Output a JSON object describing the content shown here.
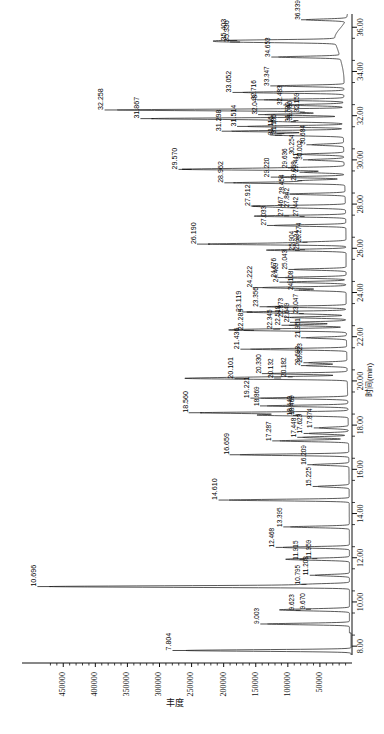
{
  "figure": {
    "name": "gc-ms-total-ion-chromatogram",
    "orientation": "rotated-90-ccw",
    "abundance_axis_title": "丰度",
    "time_axis_title": "时间(min)"
  },
  "chart_data": {
    "type": "line",
    "title": "",
    "subtitle": "",
    "xlabel": "时间(min)",
    "ylabel": "丰度",
    "xlim": [
      7.6,
      36.6
    ],
    "ylim": [
      0,
      480000
    ],
    "grid": false,
    "legend": "none",
    "x_tick_labels": [
      "8.00",
      "10.00",
      "12.00",
      "14.00",
      "16.00",
      "18.00",
      "20.00",
      "22.00",
      "24.00",
      "26.00",
      "28.00",
      "30.00",
      "32.00",
      "34.00",
      "36.00"
    ],
    "x_tick_values": [
      8,
      10,
      12,
      14,
      16,
      18,
      20,
      22,
      24,
      26,
      28,
      30,
      32,
      34,
      36
    ],
    "x_minor_tick_step": 0.5,
    "y_tick_labels": [
      "50000",
      "100000",
      "150000",
      "200000",
      "250000",
      "300000",
      "350000",
      "400000",
      "450000"
    ],
    "y_tick_values": [
      50000,
      100000,
      150000,
      200000,
      250000,
      300000,
      350000,
      400000,
      450000
    ],
    "y_minor_tick_step": 10000,
    "peaks": [
      {
        "rt": "7.804",
        "x": 7.804,
        "y": 258000
      },
      {
        "rt": "9.003",
        "x": 9.003,
        "y": 128000
      },
      {
        "rt": "9.623",
        "x": 9.623,
        "y": 76000
      },
      {
        "rt": "9.670",
        "x": 9.67,
        "y": 60000
      },
      {
        "rt": "10.696",
        "x": 10.696,
        "y": 466000
      },
      {
        "rt": "10.795",
        "x": 10.795,
        "y": 67000
      },
      {
        "rt": "11.208",
        "x": 11.208,
        "y": 54000
      },
      {
        "rt": "11.915",
        "x": 11.915,
        "y": 70000
      },
      {
        "rt": "11.959",
        "x": 11.959,
        "y": 50000
      },
      {
        "rt": "12.468",
        "x": 12.468,
        "y": 104000
      },
      {
        "rt": "13.395",
        "x": 13.395,
        "y": 92000
      },
      {
        "rt": "14.610",
        "x": 14.61,
        "y": 188000
      },
      {
        "rt": "15.225",
        "x": 15.225,
        "y": 49000
      },
      {
        "rt": "16.209",
        "x": 16.209,
        "y": 57000
      },
      {
        "rt": "16.659",
        "x": 16.659,
        "y": 170000
      },
      {
        "rt": "17.287",
        "x": 17.287,
        "y": 108000
      },
      {
        "rt": "17.448",
        "x": 17.448,
        "y": 72000
      },
      {
        "rt": "17.623",
        "x": 17.623,
        "y": 62000
      },
      {
        "rt": "17.874",
        "x": 17.874,
        "y": 46000
      },
      {
        "rt": "18.440",
        "x": 18.44,
        "y": 78000
      },
      {
        "rt": "18.469",
        "x": 18.469,
        "y": 74000
      },
      {
        "rt": "18.560",
        "x": 18.56,
        "y": 228000
      },
      {
        "rt": "18.869",
        "x": 18.869,
        "y": 126000
      },
      {
        "rt": "19.221",
        "x": 19.221,
        "y": 136000
      },
      {
        "rt": "20.101",
        "x": 20.101,
        "y": 160000
      },
      {
        "rt": "20.132",
        "x": 20.132,
        "y": 103000
      },
      {
        "rt": "20.182",
        "x": 20.182,
        "y": 85000
      },
      {
        "rt": "20.330",
        "x": 20.33,
        "y": 122000
      },
      {
        "rt": "20.693",
        "x": 20.693,
        "y": 64000
      },
      {
        "rt": "20.823",
        "x": 20.823,
        "y": 60000
      },
      {
        "rt": "21.436",
        "x": 21.436,
        "y": 150000
      },
      {
        "rt": "21.951",
        "x": 21.951,
        "y": 63000
      },
      {
        "rt": "22.289",
        "x": 22.289,
        "y": 144000
      },
      {
        "rt": "22.345",
        "x": 22.345,
        "y": 103000
      },
      {
        "rt": "22.518",
        "x": 22.518,
        "y": 90000
      },
      {
        "rt": "22.649",
        "x": 22.649,
        "y": 80000
      },
      {
        "rt": "22.873",
        "x": 22.873,
        "y": 88000
      },
      {
        "rt": "23.047",
        "x": 23.047,
        "y": 66000
      },
      {
        "rt": "23.119",
        "x": 23.119,
        "y": 146000
      },
      {
        "rt": "23.356",
        "x": 23.356,
        "y": 124000
      },
      {
        "rt": "24.108",
        "x": 24.108,
        "y": 73000
      },
      {
        "rt": "24.222",
        "x": 24.222,
        "y": 130000
      },
      {
        "rt": "24.469",
        "x": 24.469,
        "y": 93000
      },
      {
        "rt": "24.676",
        "x": 24.676,
        "y": 96000
      },
      {
        "rt": "25.043",
        "x": 25.043,
        "y": 82000
      },
      {
        "rt": "25.904",
        "x": 25.904,
        "y": 72000
      },
      {
        "rt": "25.934",
        "x": 25.934,
        "y": 64000
      },
      {
        "rt": "26.190",
        "x": 26.19,
        "y": 212000
      },
      {
        "rt": "26.274",
        "x": 26.274,
        "y": 60000
      },
      {
        "rt": "27.033",
        "x": 27.033,
        "y": 112000
      },
      {
        "rt": "27.442",
        "x": 27.442,
        "y": 64000
      },
      {
        "rt": "27.467",
        "x": 27.467,
        "y": 88000
      },
      {
        "rt": "27.842",
        "x": 27.842,
        "y": 78000
      },
      {
        "rt": "27.912",
        "x": 27.912,
        "y": 132000
      },
      {
        "rt": "28.454",
        "x": 28.454,
        "y": 86000
      },
      {
        "rt": "28.962",
        "x": 28.962,
        "y": 172000
      },
      {
        "rt": "29.058",
        "x": 29.058,
        "y": 66000
      },
      {
        "rt": "29.220",
        "x": 29.22,
        "y": 104000
      },
      {
        "rt": "29.441",
        "x": 29.441,
        "y": 62000
      },
      {
        "rt": "29.570",
        "x": 29.57,
        "y": 238000
      },
      {
        "rt": "29.636",
        "x": 29.636,
        "y": 80000
      },
      {
        "rt": "30.002",
        "x": 30.002,
        "y": 56000
      },
      {
        "rt": "30.254",
        "x": 30.254,
        "y": 68000
      },
      {
        "rt": "30.684",
        "x": 30.684,
        "y": 50000
      },
      {
        "rt": "31.116",
        "x": 31.116,
        "y": 96000
      },
      {
        "rt": "31.186",
        "x": 31.186,
        "y": 92000
      },
      {
        "rt": "31.298",
        "x": 31.298,
        "y": 174000
      },
      {
        "rt": "31.514",
        "x": 31.514,
        "y": 150000
      },
      {
        "rt": "31.730",
        "x": 31.73,
        "y": 74000
      },
      {
        "rt": "31.780",
        "x": 31.78,
        "y": 70000
      },
      {
        "rt": "31.867",
        "x": 31.867,
        "y": 296000
      },
      {
        "rt": "32.048",
        "x": 32.048,
        "y": 122000
      },
      {
        "rt": "32.159",
        "x": 32.159,
        "y": 60000
      },
      {
        "rt": "32.258",
        "x": 32.258,
        "y": 352000
      },
      {
        "rt": "32.716",
        "x": 32.716,
        "y": 124000
      },
      {
        "rt": "32.483",
        "x": 32.483,
        "y": 86000
      },
      {
        "rt": "33.052",
        "x": 33.052,
        "y": 158000
      },
      {
        "rt": "33.347",
        "x": 33.347,
        "y": 104000
      },
      {
        "rt": "34.653",
        "x": 34.653,
        "y": 96000
      },
      {
        "rt": "35.336",
        "x": 35.336,
        "y": 148000
      },
      {
        "rt": "35.403",
        "x": 35.403,
        "y": 152000
      },
      {
        "rt": "36.339",
        "x": 36.339,
        "y": 62000
      }
    ]
  }
}
